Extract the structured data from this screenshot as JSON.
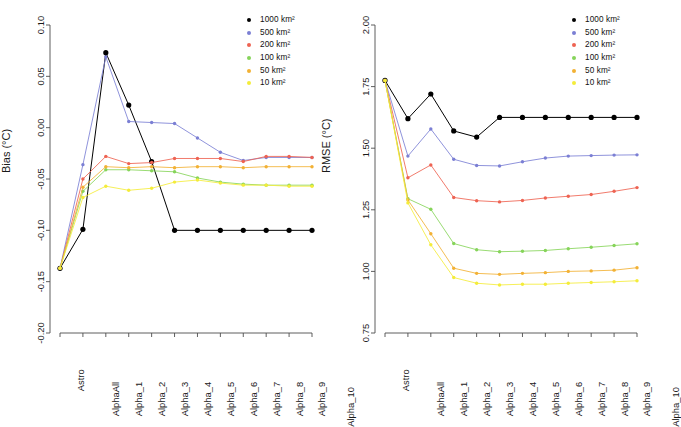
{
  "figure": {
    "background": "#ffffff",
    "panels": [
      "bias",
      "rmse"
    ]
  },
  "series_colors": {
    "1000": "#000000",
    "500": "#7b7fd4",
    "200": "#ee6352",
    "100": "#86d45a",
    "50": "#f2b134",
    "10": "#f4ec3a"
  },
  "legend": {
    "items": [
      {
        "label": "1000 km²",
        "color": "#000000"
      },
      {
        "label": "500 km²",
        "color": "#7b7fd4"
      },
      {
        "label": "200 km²",
        "color": "#ee6352"
      },
      {
        "label": "100 km²",
        "color": "#86d45a"
      },
      {
        "label": "50 km²",
        "color": "#f2b134"
      },
      {
        "label": "10 km²",
        "color": "#f4ec3a"
      }
    ]
  },
  "chart_data": [
    {
      "type": "line",
      "id": "bias",
      "title": "",
      "xlabel": "",
      "ylabel": "Bias (°C)",
      "categories": [
        "Astro",
        "AlphaAll",
        "Alpha_1",
        "Alpha_2",
        "Alpha_3",
        "Alpha_4",
        "Alpha_5",
        "Alpha_6",
        "Alpha_7",
        "Alpha_8",
        "Alpha_9",
        "Alpha_10"
      ],
      "ylim": [
        -0.2,
        0.1
      ],
      "yticks": [
        0.1,
        0.05,
        0.0,
        -0.05,
        -0.1,
        -0.15,
        -0.2
      ],
      "ytick_labels": [
        "0.10",
        "0.05",
        "0.00",
        "-0.05",
        "-0.10",
        "-0.15",
        "-0.20"
      ],
      "grid": false,
      "legend_position": "top-right",
      "series": [
        {
          "name": "1000 km²",
          "color": "#000000",
          "values": [
            -0.137,
            -0.099,
            0.073,
            0.022,
            -0.033,
            -0.1,
            -0.1,
            -0.1,
            -0.1,
            -0.1,
            -0.1,
            -0.1
          ]
        },
        {
          "name": "500 km²",
          "color": "#7b7fd4",
          "values": [
            -0.137,
            -0.036,
            0.069,
            0.006,
            0.005,
            0.004,
            -0.01,
            -0.024,
            -0.032,
            -0.029,
            -0.029,
            -0.029
          ]
        },
        {
          "name": "200 km²",
          "color": "#ee6352",
          "values": [
            -0.137,
            -0.05,
            -0.028,
            -0.035,
            -0.034,
            -0.03,
            -0.03,
            -0.03,
            -0.033,
            -0.028,
            -0.028,
            -0.029
          ]
        },
        {
          "name": "100 km²",
          "color": "#86d45a",
          "values": [
            -0.137,
            -0.062,
            -0.041,
            -0.041,
            -0.042,
            -0.043,
            -0.049,
            -0.053,
            -0.055,
            -0.056,
            -0.056,
            -0.056
          ]
        },
        {
          "name": "50 km²",
          "color": "#f2b134",
          "values": [
            -0.137,
            -0.058,
            -0.038,
            -0.039,
            -0.038,
            -0.039,
            -0.038,
            -0.038,
            -0.039,
            -0.038,
            -0.038,
            -0.038
          ]
        },
        {
          "name": "10 km²",
          "color": "#f4ec3a",
          "values": [
            -0.137,
            -0.068,
            -0.057,
            -0.061,
            -0.059,
            -0.053,
            -0.051,
            -0.054,
            -0.056,
            -0.056,
            -0.057,
            -0.057
          ]
        }
      ]
    },
    {
      "type": "line",
      "id": "rmse",
      "title": "",
      "xlabel": "",
      "ylabel": "RMSE (°C)",
      "categories": [
        "Astro",
        "AlphaAll",
        "Alpha_1",
        "Alpha_2",
        "Alpha_3",
        "Alpha_4",
        "Alpha_5",
        "Alpha_6",
        "Alpha_7",
        "Alpha_8",
        "Alpha_9",
        "Alpha_10"
      ],
      "ylim": [
        0.75,
        2.0
      ],
      "yticks": [
        2.0,
        1.75,
        1.5,
        1.25,
        1.0,
        0.75
      ],
      "ytick_labels": [
        "2.00",
        "1.75",
        "1.50",
        "1.25",
        "1.00",
        "0.75"
      ],
      "grid": false,
      "legend_position": "top-right",
      "series": [
        {
          "name": "1000 km²",
          "color": "#000000",
          "values": [
            1.775,
            1.62,
            1.72,
            1.57,
            1.545,
            1.625,
            1.625,
            1.625,
            1.625,
            1.625,
            1.625,
            1.625
          ]
        },
        {
          "name": "500 km²",
          "color": "#7b7fd4",
          "values": [
            1.775,
            1.468,
            1.578,
            1.455,
            1.43,
            1.428,
            1.445,
            1.46,
            1.468,
            1.47,
            1.472,
            1.473
          ]
        },
        {
          "name": "200 km²",
          "color": "#ee6352",
          "values": [
            1.775,
            1.38,
            1.432,
            1.3,
            1.287,
            1.282,
            1.288,
            1.298,
            1.305,
            1.312,
            1.325,
            1.34
          ]
        },
        {
          "name": "100 km²",
          "color": "#86d45a",
          "values": [
            1.775,
            1.295,
            1.252,
            1.113,
            1.088,
            1.08,
            1.082,
            1.085,
            1.092,
            1.098,
            1.105,
            1.112
          ]
        },
        {
          "name": "50 km²",
          "color": "#f2b134",
          "values": [
            1.775,
            1.29,
            1.153,
            1.013,
            0.992,
            0.988,
            0.992,
            0.995,
            1.0,
            1.002,
            1.005,
            1.015
          ]
        },
        {
          "name": "10 km²",
          "color": "#f4ec3a",
          "values": [
            1.775,
            1.278,
            1.108,
            0.975,
            0.952,
            0.945,
            0.948,
            0.948,
            0.952,
            0.955,
            0.958,
            0.962
          ]
        }
      ]
    }
  ]
}
